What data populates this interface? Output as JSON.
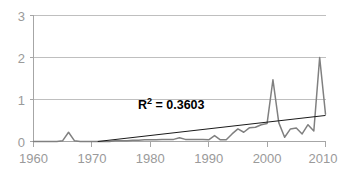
{
  "chart_data": {
    "type": "line",
    "title": "",
    "subtitle": "",
    "xlabel": "",
    "ylabel": "",
    "xlim": [
      1960,
      2010
    ],
    "ylim": [
      0,
      3
    ],
    "grid": true,
    "legend": false,
    "x_ticks": [
      "1960",
      "1970",
      "1980",
      "1990",
      "2000",
      "2010"
    ],
    "x_tick_values": [
      1960,
      1970,
      1980,
      1990,
      2000,
      2010
    ],
    "y_ticks": [
      "0",
      "1",
      "2",
      "3"
    ],
    "y_tick_values": [
      0,
      1,
      2,
      3
    ],
    "x": [
      1960,
      1961,
      1962,
      1963,
      1964,
      1965,
      1966,
      1967,
      1968,
      1969,
      1970,
      1971,
      1972,
      1973,
      1974,
      1975,
      1976,
      1977,
      1978,
      1979,
      1980,
      1981,
      1982,
      1983,
      1984,
      1985,
      1986,
      1987,
      1988,
      1989,
      1990,
      1991,
      1992,
      1993,
      1994,
      1995,
      1996,
      1997,
      1998,
      1999,
      2000,
      2001,
      2002,
      2003,
      2004,
      2005,
      2006,
      2007,
      2008,
      2009,
      2010
    ],
    "series": [
      {
        "name": "value",
        "color": "#808080",
        "values": [
          0.0,
          0.0,
          0.0,
          0.0,
          0.0,
          0.02,
          0.22,
          0.02,
          0.0,
          0.0,
          0.0,
          0.0,
          0.0,
          0.0,
          0.02,
          0.02,
          0.02,
          0.03,
          0.03,
          0.04,
          0.04,
          0.04,
          0.05,
          0.05,
          0.05,
          0.09,
          0.05,
          0.05,
          0.05,
          0.05,
          0.04,
          0.14,
          0.04,
          0.04,
          0.18,
          0.3,
          0.22,
          0.33,
          0.34,
          0.4,
          0.43,
          1.47,
          0.45,
          0.1,
          0.3,
          0.32,
          0.18,
          0.4,
          0.25,
          2.0,
          0.65
        ]
      }
    ],
    "trendline": {
      "type": "linear",
      "color": "#1a1a1a",
      "x_start": 1971,
      "y_start": 0.0,
      "x_end": 2010,
      "y_end": 0.62,
      "r_squared_label": "R",
      "r_squared_superscript": "2",
      "r_squared_equation": " = 0.3603"
    },
    "annotation": "R² = 0.3603"
  }
}
